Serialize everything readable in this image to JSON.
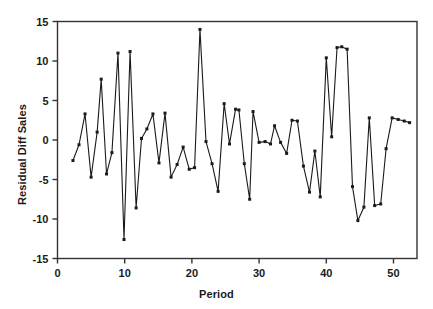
{
  "chart_data": {
    "type": "line",
    "title": "",
    "xlabel": "Period",
    "ylabel": "Residual Diff Sales",
    "xlim": [
      0,
      53.5
    ],
    "ylim": [
      -15,
      15
    ],
    "xticks": [
      0,
      10,
      20,
      30,
      40,
      50
    ],
    "yticks": [
      -15,
      -10,
      -5,
      0,
      5,
      10,
      15
    ],
    "xtick_labels": [
      "0",
      "10",
      "20",
      "30",
      "40",
      "50"
    ],
    "ytick_labels": [
      "-15",
      "-10",
      "-5",
      "0",
      "5",
      "10",
      "15"
    ],
    "grid": false,
    "legend": null,
    "marker": "filled-square",
    "line_color": "#1a1a1a",
    "series": [
      {
        "name": "Residual Diff Sales",
        "x": [
          2.3,
          3.2,
          4.1,
          5.0,
          5.9,
          6.5,
          7.3,
          8.1,
          9.0,
          9.9,
          10.8,
          11.7,
          12.5,
          13.3,
          14.2,
          15.1,
          16.0,
          16.9,
          17.8,
          18.7,
          19.6,
          20.4,
          21.2,
          22.1,
          23.0,
          23.9,
          24.8,
          25.6,
          26.5,
          27.0,
          27.8,
          28.6,
          29.1,
          30.0,
          30.9,
          31.7,
          32.3,
          33.2,
          34.1,
          34.9,
          35.7,
          36.6,
          37.5,
          38.3,
          39.1,
          40.0,
          40.8,
          41.6,
          42.3,
          43.1,
          43.9,
          44.7,
          45.6,
          46.4,
          47.2,
          48.1,
          48.9,
          49.8,
          50.7,
          51.6,
          52.4
        ],
        "y": [
          -2.6,
          -0.6,
          3.3,
          -4.7,
          1.0,
          7.7,
          -4.3,
          -1.6,
          11.0,
          -12.6,
          11.2,
          -8.6,
          0.2,
          1.4,
          3.3,
          -2.9,
          3.4,
          -4.7,
          -3.1,
          -0.9,
          -3.7,
          -3.5,
          14.0,
          -0.2,
          -3.0,
          -6.5,
          4.6,
          -0.5,
          3.9,
          3.8,
          -3.0,
          -7.5,
          3.6,
          -0.3,
          -0.2,
          -0.5,
          1.8,
          -0.3,
          -1.7,
          2.5,
          2.4,
          -3.3,
          -6.6,
          -1.4,
          -7.2,
          10.4,
          0.4,
          11.7,
          11.8,
          11.5,
          -5.9,
          -10.2,
          -8.5,
          2.8,
          -8.3,
          -8.1,
          -1.1,
          2.8,
          2.6,
          2.4,
          2.2
        ]
      }
    ]
  },
  "icons": {
    "data_marker": "square-marker-icon"
  }
}
